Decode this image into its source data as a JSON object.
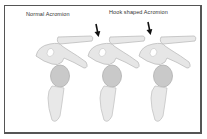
{
  "diagram": {
    "labels": {
      "normal": "Normal Acromion",
      "hook": "Hook shaped Acromion"
    },
    "panels": [
      {
        "name": "normal-acromion",
        "arrow": false
      },
      {
        "name": "hook-acromion-1",
        "arrow": true
      },
      {
        "name": "hook-acromion-2",
        "arrow": true
      }
    ],
    "colors": {
      "bone_fill": "#e6e6e6",
      "bone_stroke": "#bdbdbd",
      "humeral_head": "#c8c8c8",
      "arrow": "#111111",
      "border": "#555555"
    }
  }
}
